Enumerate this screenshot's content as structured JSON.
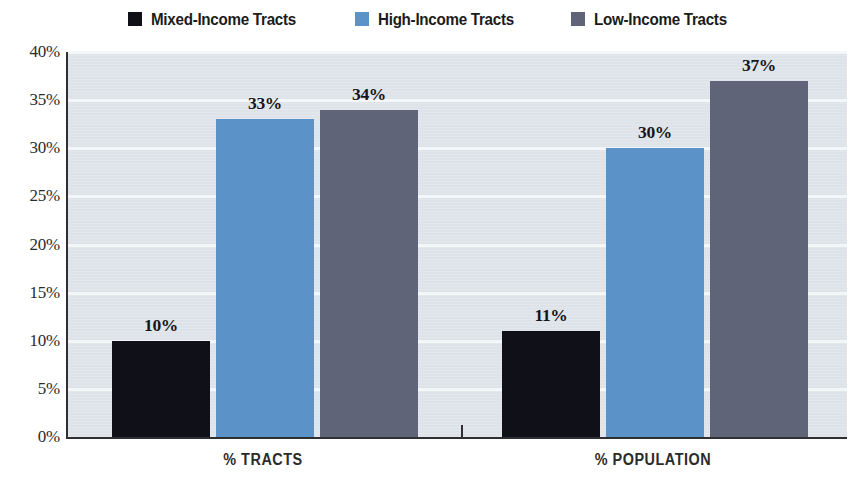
{
  "chart_data": {
    "type": "bar",
    "title": "",
    "subtitle": "",
    "xlabel": "",
    "ylabel": "",
    "categories": [
      "% TRACTS",
      "% POPULATION"
    ],
    "series": [
      {
        "name": "Mixed-Income Tracts",
        "color": "#101018",
        "values": [
          10,
          11
        ],
        "labels": [
          "10%",
          "11%"
        ]
      },
      {
        "name": "High-Income Tracts",
        "color": "#5b92c8",
        "values": [
          33,
          30
        ],
        "labels": [
          "33%",
          "30%"
        ]
      },
      {
        "name": "Low-Income Tracts",
        "color": "#5f6478",
        "values": [
          34,
          37
        ],
        "labels": [
          "34%",
          "37%"
        ]
      }
    ],
    "ylim": [
      0,
      40
    ],
    "ytick_values": [
      0,
      5,
      10,
      15,
      20,
      25,
      30,
      35,
      40
    ],
    "ytick_labels": [
      "0%",
      "5%",
      "10%",
      "15%",
      "20%",
      "25%",
      "30%",
      "35%",
      "40%"
    ],
    "grid": true,
    "legend_position": "top",
    "plot_background": "#dee3e9",
    "gridline_color": "#f4f7f9",
    "axis_color": "#2f2f33",
    "data_labels_shown": true
  },
  "legend": {
    "items": [
      {
        "label": "Mixed-Income Tracts",
        "color": "#101018"
      },
      {
        "label": "High-Income Tracts",
        "color": "#5b92c8"
      },
      {
        "label": "Low-Income Tracts",
        "color": "#5f6478"
      }
    ]
  },
  "y_axis": {
    "ticks": [
      {
        "label": "40%",
        "value": 40
      },
      {
        "label": "35%",
        "value": 35
      },
      {
        "label": "30%",
        "value": 30
      },
      {
        "label": "25%",
        "value": 25
      },
      {
        "label": "20%",
        "value": 20
      },
      {
        "label": "15%",
        "value": 15
      },
      {
        "label": "10%",
        "value": 10
      },
      {
        "label": "5%",
        "value": 5
      },
      {
        "label": "0%",
        "value": 0
      }
    ]
  },
  "x_axis": {
    "groups": [
      {
        "label": "% TRACTS"
      },
      {
        "label": "% POPULATION"
      }
    ]
  },
  "bars": [
    {
      "group": 0,
      "series": 0,
      "name": "Mixed-Income Tracts",
      "value": 10,
      "label": "10%",
      "color": "#101018"
    },
    {
      "group": 0,
      "series": 1,
      "name": "High-Income Tracts",
      "value": 33,
      "label": "33%",
      "color": "#5b92c8"
    },
    {
      "group": 0,
      "series": 2,
      "name": "Low-Income Tracts",
      "value": 34,
      "label": "34%",
      "color": "#5f6478"
    },
    {
      "group": 1,
      "series": 0,
      "name": "Mixed-Income Tracts",
      "value": 11,
      "label": "11%",
      "color": "#101018"
    },
    {
      "group": 1,
      "series": 1,
      "name": "High-Income Tracts",
      "value": 30,
      "label": "30%",
      "color": "#5b92c8"
    },
    {
      "group": 1,
      "series": 2,
      "name": "Low-Income Tracts",
      "value": 37,
      "label": "37%",
      "color": "#5f6478"
    }
  ]
}
